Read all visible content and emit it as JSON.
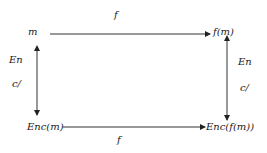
{
  "diagram": {
    "type": "commutative-diagram",
    "nodes": {
      "top_left": "m",
      "top_right": "f(m)",
      "bottom_left": "Enc(m)",
      "bottom_right": "Enc(f(m))"
    },
    "edges": {
      "top": {
        "label": "f",
        "from": "m",
        "to": "f(m)"
      },
      "bottom": {
        "label": "f",
        "from": "Enc(m)",
        "to": "Enc(f(m))"
      },
      "left": {
        "label_line1": "En",
        "label_line2": "c/",
        "between": [
          "m",
          "Enc(m)"
        ],
        "direction": "bidirectional"
      },
      "right": {
        "label_line1": "En",
        "label_line2": "c/",
        "between": [
          "f(m)",
          "Enc(f(m))"
        ],
        "direction": "bidirectional"
      }
    },
    "colors": {
      "stroke": "#222222",
      "background": "#ffffff"
    }
  }
}
